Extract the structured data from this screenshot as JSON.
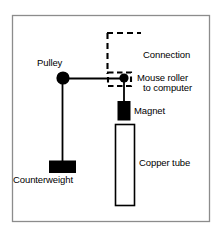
{
  "figure": {
    "background_color": "#ffffff",
    "stroke_color": "#000000",
    "frame_color": "#999999",
    "labels": {
      "connection_line1": "Connection",
      "connection_line2": "to computer",
      "mouse_roller": "Mouse roller",
      "magnet": "Magnet",
      "copper_tube": "Copper tube",
      "pulley": "Pulley",
      "counterweight": "Counterweight"
    },
    "parts": {
      "pulley_icon": "pulley-circle",
      "roller_icon": "roller-dot",
      "magnet_icon": "magnet-block",
      "copper_tube_icon": "tube-outline",
      "counterweight_icon": "counterweight-block",
      "connection_icon": "dashed-connection-line",
      "mouse_body_icon": "dashed-mouse-outline",
      "string_icon": "string-line"
    }
  }
}
